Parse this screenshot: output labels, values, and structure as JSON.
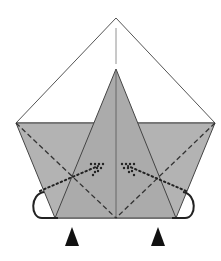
{
  "diagram": {
    "type": "origami-fold-step",
    "colors": {
      "paper_front": "#ffffff",
      "paper_back": "#b3b3b3",
      "line": "#3a3a3a",
      "arrow": "#111111"
    },
    "elements": [
      "outer-triangle-flap",
      "gray-base-trapezoid",
      "center-kite-flap",
      "valley-fold-dashed-lines",
      "mountain-fold-dotted-lines",
      "inside-reverse-fold-arrows",
      "push-here-triangle-markers"
    ]
  }
}
